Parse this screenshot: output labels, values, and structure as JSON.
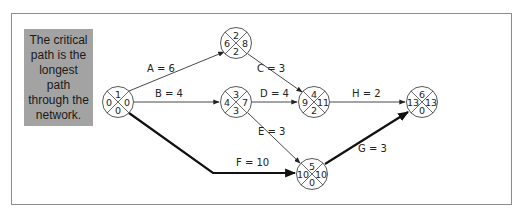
{
  "callout": {
    "text": "The critical path is the longest path through the network.",
    "background": "#a3a3a3"
  },
  "nodes": [
    {
      "id": "1",
      "top": "1",
      "left": "0",
      "right": "0",
      "bottom": "0"
    },
    {
      "id": "2",
      "top": "2",
      "left": "6",
      "right": "8",
      "bottom": "2"
    },
    {
      "id": "3",
      "top": "3",
      "left": "4",
      "right": "7",
      "bottom": "3"
    },
    {
      "id": "4",
      "top": "4",
      "left": "9",
      "right": "11",
      "bottom": "2"
    },
    {
      "id": "5",
      "top": "5",
      "left": "10",
      "right": "10",
      "bottom": "0"
    },
    {
      "id": "6",
      "top": "6",
      "left": "13",
      "right": "13",
      "bottom": "0"
    }
  ],
  "edges": [
    {
      "label": "A = 6",
      "from": "1",
      "to": "2",
      "critical": false
    },
    {
      "label": "B = 4",
      "from": "1",
      "to": "3",
      "critical": false
    },
    {
      "label": "C = 3",
      "from": "2",
      "to": "4",
      "critical": false
    },
    {
      "label": "D = 4",
      "from": "3",
      "to": "4",
      "critical": false
    },
    {
      "label": "E = 3",
      "from": "3",
      "to": "5",
      "critical": false
    },
    {
      "label": "F = 10",
      "from": "1",
      "to": "5",
      "critical": true
    },
    {
      "label": "G = 3",
      "from": "5",
      "to": "6",
      "critical": true
    },
    {
      "label": "H = 2",
      "from": "4",
      "to": "6",
      "critical": false
    }
  ]
}
